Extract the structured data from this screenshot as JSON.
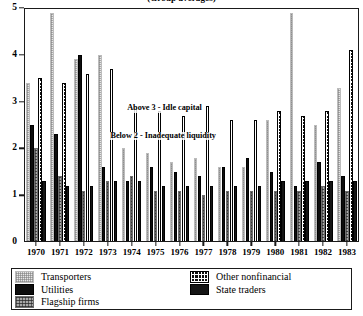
{
  "chart": {
    "title": "(Group averages)",
    "annotations": [
      {
        "text": "Above 3 - Idle capital",
        "x_pct": 30.5,
        "y_value": 2.94
      },
      {
        "text": "Below 2 - Inadequate liquidity",
        "x_pct": 25.5,
        "y_value": 2.36
      }
    ]
  },
  "legend": {
    "left": [
      {
        "label": "Transporters",
        "series_key": "transporters",
        "swatch": "light-gray-stipple"
      },
      {
        "label": "Utilities",
        "series_key": "utilities",
        "swatch": "solid-black"
      },
      {
        "label": "Flagship firms",
        "series_key": "flagship",
        "swatch": "mid-gray-hatch"
      }
    ],
    "right": [
      {
        "label": "Other nonfinancial",
        "series_key": "othernonfin",
        "swatch": "black-dot-grid"
      },
      {
        "label": "State traders",
        "series_key": "statetraders",
        "swatch": "solid-dark"
      }
    ]
  },
  "chart_data": {
    "type": "bar",
    "title": "(Group averages)",
    "xlabel": "",
    "ylabel": "",
    "ylim": [
      0,
      5
    ],
    "yticks": [
      0,
      1,
      2,
      3,
      4,
      5
    ],
    "grid": false,
    "legend_position": "below-plot",
    "categories": [
      "1970",
      "1971",
      "1972",
      "1973",
      "1974",
      "1975",
      "1976",
      "1977",
      "1978",
      "1979",
      "1980",
      "1981",
      "1982",
      "1983"
    ],
    "series": [
      {
        "name": "Transporters",
        "key": "transporters",
        "color": "#e7e7e7",
        "values": [
          3.4,
          4.9,
          3.9,
          4.0,
          2.0,
          1.9,
          1.7,
          1.8,
          1.6,
          1.6,
          2.6,
          4.9,
          2.5,
          3.3
        ]
      },
      {
        "name": "Utilities",
        "key": "utilities",
        "color": "#0d0d0d",
        "values": [
          2.5,
          2.3,
          4.0,
          1.6,
          1.3,
          1.6,
          1.5,
          1.4,
          1.6,
          1.8,
          1.5,
          1.2,
          1.7,
          1.4
        ]
      },
      {
        "name": "Flagship firms",
        "key": "flagship",
        "color": "#a9a9a9",
        "values": [
          2.0,
          1.4,
          1.1,
          1.3,
          1.4,
          1.1,
          1.1,
          1.0,
          1.1,
          1.1,
          1.1,
          1.1,
          1.2,
          1.1
        ]
      },
      {
        "name": "Other nonfinancial",
        "key": "othernonfin",
        "color": "#101010",
        "values": [
          3.5,
          3.4,
          3.6,
          3.7,
          2.9,
          2.8,
          2.7,
          2.9,
          2.6,
          2.6,
          2.8,
          2.7,
          2.8,
          4.1
        ]
      },
      {
        "name": "State traders",
        "key": "statetraders",
        "color": "#151515",
        "values": [
          1.3,
          1.2,
          1.2,
          1.3,
          1.3,
          1.2,
          1.2,
          1.2,
          1.2,
          1.2,
          1.3,
          1.3,
          1.3,
          1.3
        ]
      }
    ],
    "annotations": [
      "Above 3 - Idle capital",
      "Below 2 - Inadequate liquidity"
    ]
  }
}
